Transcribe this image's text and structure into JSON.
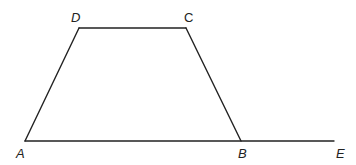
{
  "diagram": {
    "type": "geometry",
    "colors": {
      "line": "#222222",
      "background": "#ffffff"
    },
    "points": [
      {
        "id": "A",
        "label": "A",
        "x": 25,
        "y": 141,
        "label_x": 16,
        "label_y": 158,
        "italic": true
      },
      {
        "id": "B",
        "label": "B",
        "x": 241,
        "y": 141,
        "label_x": 238,
        "label_y": 158,
        "italic": true
      },
      {
        "id": "C",
        "label": "C",
        "x": 186,
        "y": 28,
        "label_x": 184,
        "label_y": 22,
        "italic": false
      },
      {
        "id": "D",
        "label": "D",
        "x": 79,
        "y": 28,
        "label_x": 71,
        "label_y": 22,
        "italic": true
      },
      {
        "id": "E",
        "label": "E",
        "x": 334,
        "y": 141,
        "label_x": 336,
        "label_y": 158,
        "italic": true
      }
    ],
    "segments": [
      {
        "id": "AD",
        "from": "A",
        "to": "D"
      },
      {
        "id": "DC",
        "from": "D",
        "to": "C"
      },
      {
        "id": "CB",
        "from": "C",
        "to": "B"
      },
      {
        "id": "AE",
        "from": "A",
        "to": "E"
      }
    ]
  }
}
